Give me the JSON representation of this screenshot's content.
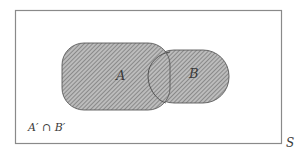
{
  "diagram": {
    "type": "venn",
    "universe_label": "S",
    "sets": [
      {
        "name": "A",
        "label": "A",
        "shaded": true
      },
      {
        "name": "B",
        "label": "B",
        "shaded": true
      }
    ],
    "region_label": "A′ ∩ B′",
    "colors": {
      "border": "#8a8a8a",
      "outline": "#555555",
      "fill": "#b4b4b4",
      "hatch": "#6e6e6e"
    }
  }
}
